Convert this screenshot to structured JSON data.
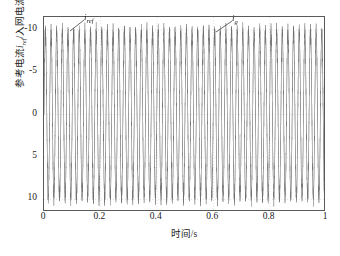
{
  "figure": {
    "background_color": "#ffffff",
    "frame_color": "#5a5a5a"
  },
  "axes": {
    "x_title": "时间/s",
    "x_ticks": [
      "0",
      "0.2",
      "0.4",
      "0.6",
      "0.8",
      "1"
    ],
    "y_ticks": [
      "10",
      "5",
      "0",
      "-5",
      "-10"
    ],
    "y_title_part1": "参考电流",
    "y_title_iref": "i",
    "y_title_iref_sub": "ref",
    "y_title_part2": "/入网电流",
    "y_title_ig": "i",
    "y_title_ig_sub": "g"
  },
  "annotations": [
    {
      "name": "iref",
      "symbol": "i",
      "subscript": "ref",
      "label_x": 84,
      "label_y": 13,
      "leader_x1": 70,
      "leader_y1": 31,
      "leader_x2": 84,
      "leader_y2": 20
    },
    {
      "name": "ig",
      "symbol": "i",
      "subscript": "g",
      "label_x": 232,
      "label_y": 14,
      "leader_x1": 216,
      "leader_y1": 32,
      "leader_x2": 232,
      "leader_y2": 21
    }
  ],
  "chart_data": {
    "type": "line",
    "title": "",
    "xlabel": "时间/s",
    "ylabel": "参考电流i_ref/入网电流i_g",
    "xlim": [
      0,
      1
    ],
    "ylim": [
      -11.5,
      11.5
    ],
    "xticks": [
      0,
      0.2,
      0.4,
      0.6,
      0.8,
      1
    ],
    "yticks": [
      -10,
      -5,
      0,
      5,
      10
    ],
    "grid": true,
    "grid_style": "dotted",
    "legend": "annotated-inline",
    "series": [
      {
        "name": "i_ref",
        "label": "参考电流 i_ref",
        "color": "#8c8c8c",
        "linewidth": 0.5,
        "waveform": "sine",
        "amplitude": 10,
        "frequency_hz": 50,
        "phase_deg": 0,
        "offset": 0,
        "duration_s": 1,
        "samples": 4000
      },
      {
        "name": "i_g",
        "label": "入网电流 i_g",
        "color": "#6e6e6e",
        "linewidth": 0.5,
        "waveform": "sine-with-ripple",
        "amplitude": 10,
        "frequency_hz": 50,
        "phase_deg": 0,
        "offset": 0,
        "ripple_amplitude": 0.55,
        "ripple_frequency_hz": 1650,
        "noise_amplitude": 0.35,
        "duration_s": 1,
        "samples": 4000
      }
    ]
  }
}
